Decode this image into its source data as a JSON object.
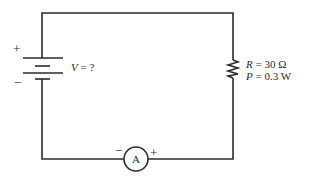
{
  "diagram": {
    "type": "circuit",
    "battery": {
      "positive_sign": "+",
      "negative_sign": "−",
      "label_var": "V",
      "label_rest": " = ?"
    },
    "resistor": {
      "r_var": "R",
      "r_rest": " = 30 Ω",
      "p_var": "P",
      "p_rest": " = 0.3 W"
    },
    "ammeter": {
      "symbol": "A",
      "negative_sign": "−",
      "positive_sign": "+"
    }
  }
}
